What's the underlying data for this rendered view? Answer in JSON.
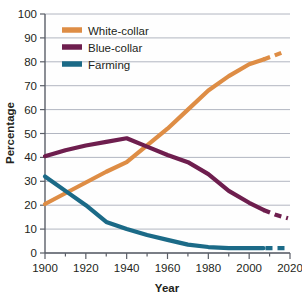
{
  "chart_data": {
    "type": "line",
    "title": "",
    "xlabel": "Year",
    "ylabel": "Percentage",
    "xlim": [
      1900,
      2020
    ],
    "ylim": [
      0,
      100
    ],
    "grid": true,
    "legend_position": "top-left",
    "x_ticks": [
      1900,
      1920,
      1940,
      1960,
      1980,
      2000,
      2020
    ],
    "x_minor_tick_step": 10,
    "y_ticks": [
      0,
      10,
      20,
      30,
      40,
      50,
      60,
      70,
      80,
      90,
      100
    ],
    "series": [
      {
        "name": "White-collar",
        "color": "#DE8D45",
        "x": [
          1900,
          1910,
          1920,
          1930,
          1940,
          1950,
          1960,
          1970,
          1980,
          1990,
          2000,
          2007
        ],
        "values": [
          20.5,
          25,
          29.5,
          34,
          38,
          45,
          52,
          60,
          68,
          74,
          79,
          81
        ],
        "projected_x": [
          2007,
          2012,
          2018
        ],
        "projected_values": [
          81,
          82.5,
          84.5
        ],
        "projected_style": "dashed"
      },
      {
        "name": "Blue-collar",
        "color": "#6E1E4E",
        "x": [
          1900,
          1910,
          1920,
          1930,
          1940,
          1950,
          1960,
          1970,
          1980,
          1990,
          2000,
          2007
        ],
        "values": [
          40.5,
          43,
          45,
          46.5,
          48,
          44.5,
          41,
          38,
          33,
          26,
          21,
          18
        ],
        "projected_x": [
          2007,
          2013,
          2019
        ],
        "projected_values": [
          18,
          16,
          14.5
        ],
        "projected_style": "dashed"
      },
      {
        "name": "Farming",
        "color": "#1B6A87",
        "x": [
          1900,
          1910,
          1920,
          1930,
          1940,
          1950,
          1960,
          1970,
          1980,
          1990,
          2000,
          2007
        ],
        "values": [
          32,
          26,
          20,
          13,
          10,
          7.5,
          5.5,
          3.5,
          2.5,
          2,
          2,
          2
        ],
        "projected_x": [
          2008,
          2013,
          2019
        ],
        "projected_values": [
          2,
          2,
          2
        ],
        "projected_style": "dashed"
      }
    ],
    "legend": [
      {
        "label": "White-collar",
        "color": "#DE8D45"
      },
      {
        "label": "Blue-collar",
        "color": "#6E1E4E"
      },
      {
        "label": "Farming",
        "color": "#1B6A87"
      }
    ],
    "axis_tick_labels_x": [
      "1900",
      "1920",
      "1940",
      "1960",
      "1980",
      "2000",
      "2020"
    ],
    "axis_tick_labels_y": [
      "0",
      "10",
      "20",
      "30",
      "40",
      "50",
      "60",
      "70",
      "80",
      "90",
      "100"
    ],
    "colors": {
      "white_collar": "#DE8D45",
      "blue_collar": "#6E1E4E",
      "farming": "#1B6A87",
      "gridline": "#A9AEBA",
      "axis": "#5B5F68",
      "plot_background": "#FEFEFE",
      "text": "#231f20"
    }
  }
}
